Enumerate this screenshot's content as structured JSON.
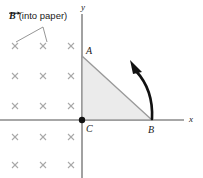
{
  "figure": {
    "caption": {
      "symbol": "B",
      "symbol_icon": "vector-arrow-over-b",
      "text": "(into paper)"
    },
    "axes": {
      "x_label": "x",
      "y_label": "y",
      "x_axis_y": 120,
      "y_axis_x": 82,
      "axis_color": "#8a8a8a"
    },
    "vertices": [
      {
        "name": "A",
        "label": "A",
        "x": 82,
        "y": 56
      },
      {
        "name": "B",
        "label": "B",
        "x": 152,
        "y": 120
      },
      {
        "name": "C",
        "label": "C",
        "x": 82,
        "y": 120
      }
    ],
    "triangle": {
      "fill": "#ebebeb",
      "stroke": "#9a9a9a",
      "points": "82,56 152,120 82,120"
    },
    "origin_dot": {
      "name": "origin-dot",
      "x": 82,
      "y": 120,
      "r": 3,
      "color": "#111111"
    },
    "field": {
      "marker": "x",
      "marker_meaning": "magnetic-field-into-page",
      "color": "#a9a9a9",
      "columns": [
        15,
        43,
        71
      ],
      "rows": [
        46,
        76,
        106,
        137,
        165
      ]
    },
    "leader_lines": {
      "origin": {
        "x": 43,
        "y": 27
      },
      "targets": [
        {
          "x": 16,
          "y": 43
        },
        {
          "x": 47,
          "y": 43
        }
      ],
      "color": "#8a8a8a"
    },
    "rotation_arrow": {
      "meaning": "counterclockwise-rotation-about-B",
      "color": "#111111",
      "path": "M 152,119 C 152,101 148,85 137,70",
      "arrowhead": "130,61 142,70 135,73"
    }
  }
}
